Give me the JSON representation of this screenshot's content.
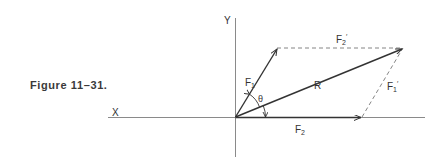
{
  "figure": {
    "caption": "Figure 11–31."
  },
  "axes": {
    "x_label": "X",
    "y_label": "Y"
  },
  "vectors": {
    "F1": {
      "label": "F",
      "sub": "1",
      "type": "solid-arrow"
    },
    "F2": {
      "label": "F",
      "sub": "2",
      "type": "solid-arrow"
    },
    "R": {
      "label": "R",
      "type": "solid-arrow"
    },
    "F1_prime": {
      "label": "F",
      "sub": "1",
      "prime": "′",
      "type": "dashed"
    },
    "F2_prime": {
      "label": "F",
      "sub": "2",
      "prime": "′",
      "type": "dashed"
    }
  },
  "angle": {
    "label": "θ"
  },
  "colors": {
    "line": "#333333",
    "dashed": "#777777",
    "axis": "#8a8a8a"
  }
}
